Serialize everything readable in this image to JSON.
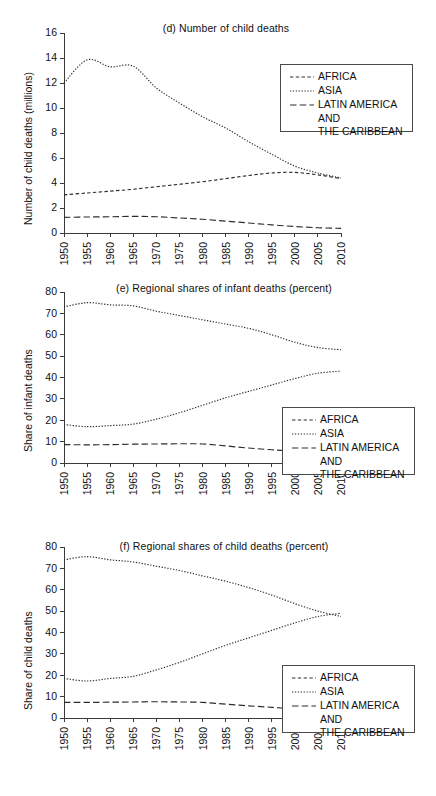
{
  "figure": {
    "series_names": [
      "AFRICA",
      "ASIA",
      "LATIN AMERICA AND THE CARIBBEAN"
    ],
    "legend_labels": {
      "africa": "AFRICA",
      "asia": "ASIA",
      "latin": "LATIN AMERICA AND\nTHE CARIBBEAN"
    }
  },
  "chart_data": [
    {
      "id": "d",
      "type": "line",
      "title": "(d) Number of child deaths",
      "xlabel": "",
      "ylabel": "Number of child deaths (millions)",
      "xlim": [
        1950,
        2010
      ],
      "ylim": [
        0,
        16
      ],
      "yticks": [
        0,
        2,
        4,
        6,
        8,
        10,
        12,
        14,
        16
      ],
      "grid": false,
      "legend_position": "top-right",
      "x": [
        1950,
        1955,
        1960,
        1965,
        1970,
        1975,
        1980,
        1985,
        1990,
        1995,
        2000,
        2005,
        2010
      ],
      "categories": [
        "1950",
        "1955",
        "1960",
        "1965",
        "1970",
        "1975",
        "1980",
        "1985",
        "1990",
        "1995",
        "2000",
        "2005",
        "2010"
      ],
      "series": [
        {
          "name": "AFRICA",
          "style": "dashed-short",
          "values": [
            3.05,
            3.2,
            3.35,
            3.5,
            3.7,
            3.9,
            4.1,
            4.35,
            4.6,
            4.8,
            4.85,
            4.65,
            4.35
          ]
        },
        {
          "name": "ASIA",
          "style": "dotted",
          "values": [
            12.0,
            13.85,
            13.3,
            13.35,
            11.6,
            10.4,
            9.3,
            8.4,
            7.3,
            6.3,
            5.35,
            4.8,
            4.4
          ]
        },
        {
          "name": "LATIN AMERICA AND THE CARIBBEAN",
          "style": "dashed-long",
          "values": [
            1.25,
            1.28,
            1.3,
            1.33,
            1.3,
            1.2,
            1.1,
            0.95,
            0.8,
            0.65,
            0.52,
            0.42,
            0.37
          ]
        }
      ]
    },
    {
      "id": "e",
      "type": "line",
      "title": "(e) Regional shares of infant deaths (percent)",
      "xlabel": "",
      "ylabel": "Share of infant deaths",
      "xlim": [
        1950,
        2010
      ],
      "ylim": [
        0,
        80
      ],
      "yticks": [
        0,
        10,
        20,
        30,
        40,
        50,
        60,
        70,
        80
      ],
      "grid": false,
      "legend_position": "bottom-right",
      "x": [
        1950,
        1955,
        1960,
        1965,
        1970,
        1975,
        1980,
        1985,
        1990,
        1995,
        2000,
        2005,
        2010
      ],
      "categories": [
        "1950",
        "1955",
        "1960",
        "1965",
        "1970",
        "1975",
        "1980",
        "1985",
        "1990",
        "1995",
        "2000",
        "2005",
        "2010"
      ],
      "series": [
        {
          "name": "AFRICA",
          "style": "dotted",
          "values": [
            18.0,
            17.0,
            17.5,
            18.2,
            20.5,
            23.5,
            27.0,
            30.5,
            33.5,
            36.5,
            39.5,
            42.0,
            43.0
          ]
        },
        {
          "name": "ASIA",
          "style": "dotted",
          "values": [
            73.0,
            75.0,
            74.0,
            73.5,
            71.0,
            69.0,
            67.0,
            65.0,
            63.0,
            60.0,
            56.5,
            54.0,
            53.0
          ]
        },
        {
          "name": "LATIN AMERICA AND THE CARIBBEAN",
          "style": "dashed-long",
          "values": [
            8.6,
            8.5,
            8.6,
            8.8,
            8.9,
            9.0,
            8.9,
            8.0,
            7.0,
            6.2,
            5.5,
            4.8,
            4.2
          ]
        }
      ]
    },
    {
      "id": "f",
      "type": "line",
      "title": "(f) Regional shares of child deaths (percent)",
      "xlabel": "",
      "ylabel": "Share of child deaths",
      "xlim": [
        1950,
        2010
      ],
      "ylim": [
        0,
        80
      ],
      "yticks": [
        0,
        10,
        20,
        30,
        40,
        50,
        60,
        70,
        80
      ],
      "grid": false,
      "legend_position": "bottom-right",
      "x": [
        1950,
        1955,
        1960,
        1965,
        1970,
        1975,
        1980,
        1985,
        1990,
        1995,
        2000,
        2005,
        2010
      ],
      "categories": [
        "1950",
        "1955",
        "1960",
        "1965",
        "1970",
        "1975",
        "1980",
        "1985",
        "1990",
        "1995",
        "2000",
        "2005",
        "2010"
      ],
      "series": [
        {
          "name": "AFRICA",
          "style": "dotted",
          "values": [
            18.5,
            17.3,
            18.5,
            19.5,
            22.5,
            26.0,
            30.0,
            34.0,
            37.5,
            41.0,
            44.5,
            47.5,
            49.0
          ]
        },
        {
          "name": "ASIA",
          "style": "dotted",
          "values": [
            74.0,
            75.5,
            74.0,
            73.0,
            71.0,
            69.0,
            66.5,
            64.0,
            61.0,
            57.5,
            53.5,
            50.0,
            47.5
          ]
        },
        {
          "name": "LATIN AMERICA AND THE CARIBBEAN",
          "style": "dashed-long",
          "values": [
            7.3,
            7.3,
            7.4,
            7.5,
            7.6,
            7.5,
            7.3,
            6.5,
            5.7,
            5.0,
            4.3,
            3.9,
            3.8
          ]
        }
      ]
    }
  ]
}
